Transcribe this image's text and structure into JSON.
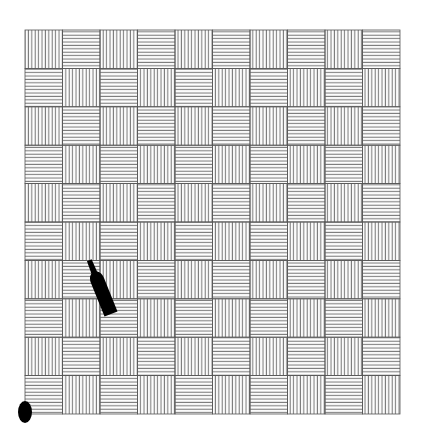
{
  "scene": {
    "description": "Checkerboard floor of hatched tiles with a bottle and a black oval",
    "background_color": "#ffffff",
    "grid": {
      "left": 25,
      "top": 30,
      "width": 375,
      "height": 384,
      "rows": 10,
      "cols": 10,
      "line_color": "#777777",
      "border_color": "#555555",
      "line_spacing": 3.4,
      "pattern": "vertical hatch when (row+col) even, horizontal hatch when odd"
    },
    "objects": [
      {
        "name": "bottle",
        "color": "#000000",
        "neck_top": [
          88,
          255
        ],
        "base_center": [
          111,
          314
        ],
        "body_width": 14
      },
      {
        "name": "oval",
        "color": "#000000",
        "center": [
          25,
          412
        ],
        "rx": 7,
        "ry": 11
      }
    ]
  }
}
